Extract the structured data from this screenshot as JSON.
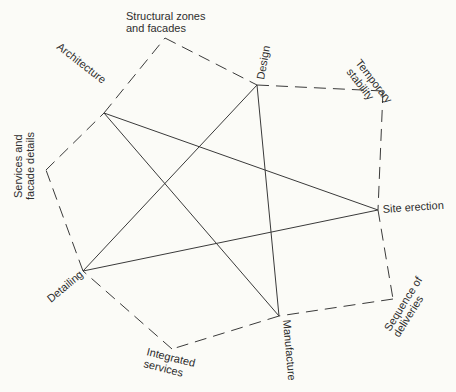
{
  "diagram": {
    "type": "star-network",
    "primary_nodes": {
      "architecture": {
        "label": "Architecture",
        "x": 104,
        "y": 113
      },
      "design": {
        "label": "Design",
        "x": 257,
        "y": 85
      },
      "site_erection": {
        "label": "Site erection",
        "x": 378,
        "y": 210
      },
      "manufacture": {
        "label": "Manufacture",
        "x": 279,
        "y": 316
      },
      "detailing": {
        "label": "Detailing",
        "x": 83,
        "y": 271
      }
    },
    "secondary_nodes": {
      "structural_zones": {
        "label_line1": "Structural zones",
        "label_line2": "and facades",
        "x": 165,
        "y": 38
      },
      "temporary_stability": {
        "label_line1": "Temporary",
        "label_line2": "stability",
        "x": 383,
        "y": 91
      },
      "sequence_of_deliveries": {
        "label_line1": "Sequence of",
        "label_line2": "deliveries",
        "x": 393,
        "y": 299
      },
      "integrated_services": {
        "label_line1": "Integrated",
        "label_line2": "services",
        "x": 172,
        "y": 349
      },
      "services_facade": {
        "label_line1": "Services and",
        "label_line2": "facade details",
        "x": 46,
        "y": 170
      }
    },
    "solid_links": [
      [
        "architecture",
        "site_erection"
      ],
      [
        "architecture",
        "manufacture"
      ],
      [
        "design",
        "detailing"
      ],
      [
        "design",
        "manufacture"
      ],
      [
        "detailing",
        "site_erection"
      ]
    ],
    "dashed_outline_order": [
      "architecture",
      "structural_zones",
      "design",
      "temporary_stability",
      "site_erection",
      "sequence_of_deliveries",
      "manufacture",
      "integrated_services",
      "detailing",
      "services_facade"
    ]
  }
}
